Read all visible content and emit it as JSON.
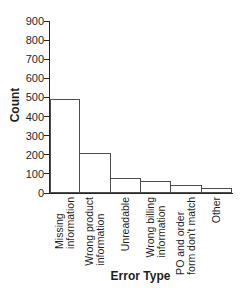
{
  "chart_data": {
    "type": "bar",
    "title": "",
    "xlabel": "Error Type",
    "ylabel": "Count",
    "categories": [
      "Missing\ninformation",
      "Wrong product\ninformation",
      "Unreadable",
      "Wrong billing\ninformation",
      "PO and order\nform don't match",
      "Other"
    ],
    "values": [
      490,
      210,
      80,
      65,
      40,
      25
    ],
    "ylim": [
      0,
      900
    ],
    "yticks": [
      0,
      100,
      200,
      300,
      400,
      500,
      600,
      700,
      800,
      900
    ],
    "grid": false,
    "legend": null,
    "bar_orientation": "vertical",
    "colors": {
      "background": "#ffffff",
      "bar_fill": "#ffffff",
      "bar_border": "#4d4d4d",
      "axis": "#262626",
      "text": "#1f1f1f"
    }
  }
}
